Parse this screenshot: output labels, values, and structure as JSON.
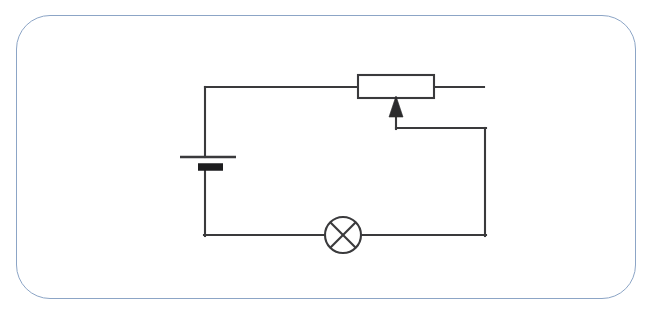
{
  "figure": {
    "kind": "circuit-schematic",
    "width": 654,
    "height": 316,
    "background_color": "#ffffff"
  },
  "frame": {
    "name": "rounded-card-border",
    "stroke_color": "#8ca5c6",
    "stroke_width": 1.6,
    "corner_radius": 34,
    "x": 16,
    "y": 15,
    "width": 620,
    "height": 284
  },
  "style": {
    "wire_color": "#3a3a3c",
    "wire_width": 2.1,
    "component_fill": "#ffffff",
    "plate_negative_color": "#1d1d1f",
    "arrow_fill": "#2b2b2d"
  },
  "components": [
    {
      "id": "battery",
      "label": "Battery cell",
      "symbol": "cell",
      "terminal_long_plate": {
        "y": 157,
        "x1": 180,
        "x2": 236,
        "polarity": "positive"
      },
      "terminal_short_plate": {
        "y": 167,
        "x1": 198,
        "x2": 223,
        "polarity": "negative"
      },
      "lead_top": {
        "x": 205,
        "y1": 88,
        "y2": 157
      },
      "lead_bottom": {
        "x": 205,
        "y1": 167,
        "y2": 235
      }
    },
    {
      "id": "lamp",
      "label": "Lamp",
      "symbol": "crossed-circle",
      "center_x": 343,
      "center_y": 235,
      "radius": 18
    },
    {
      "id": "rheostat",
      "label": "Rheostat / variable resistor",
      "symbol": "rectangle-with-wiper-arrow",
      "box": {
        "x": 358,
        "y": 75,
        "width": 76,
        "height": 23
      },
      "lead_left": {
        "x1": 205,
        "x2": 358,
        "y": 87
      },
      "lead_right": {
        "x1": 434,
        "x2": 484,
        "y": 87,
        "note": "free end"
      },
      "wiper": {
        "arrow_tip_x": 396,
        "arrow_tip_y": 97,
        "arrow_base_y": 117,
        "arrow_half_width": 7,
        "stem_x": 396,
        "stem_y2": 128
      }
    }
  ],
  "wires": [
    {
      "id": "wire-top",
      "name": "battery-to-rheostat",
      "path": "M 205 88 L 205 157"
    },
    {
      "id": "wire-top-horizontal",
      "name": "top-rail",
      "path": "M 205 87 L 358 87"
    },
    {
      "id": "wire-rheostat-right-lead",
      "name": "rheostat-right-free-lead",
      "path": "M 434 87 L 484 87"
    },
    {
      "id": "wire-wiper-stem",
      "name": "wiper-stem",
      "path": "M 396 117 L 396 128"
    },
    {
      "id": "wire-wiper-to-right-rail",
      "name": "wiper-horizontal",
      "path": "M 396 128 L 485 128"
    },
    {
      "id": "wire-right-rail",
      "name": "right-vertical-rail",
      "path": "M 485 128 L 485 235"
    },
    {
      "id": "wire-bottom-right",
      "name": "lamp-to-right-rail",
      "path": "M 361 235 L 485 235"
    },
    {
      "id": "wire-bottom-left",
      "name": "battery-to-lamp",
      "path": "M 205 235 L 325 235"
    },
    {
      "id": "wire-battery-bottom",
      "name": "battery-bottom-lead",
      "path": "M 205 167 L 205 235"
    }
  ],
  "annotations": {
    "visible_text": []
  }
}
